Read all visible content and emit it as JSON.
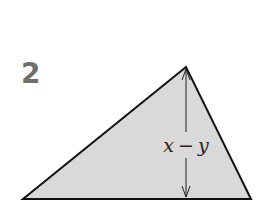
{
  "problem": {
    "number": "2"
  },
  "figure": {
    "shape": "triangle",
    "fill_color": "#d9d9d9",
    "stroke_color": "#111111",
    "vertices": {
      "apex": [
        186,
        67
      ],
      "left": [
        23,
        199
      ],
      "right": [
        251,
        199
      ]
    },
    "height_label": {
      "var1": "x",
      "op": "−",
      "var2": "y"
    }
  }
}
